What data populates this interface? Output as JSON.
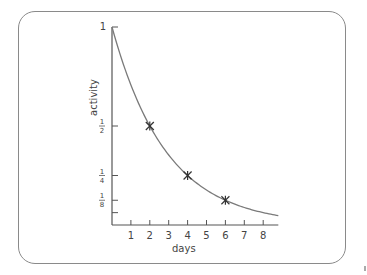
{
  "chart_data": {
    "type": "line",
    "title": "",
    "xlabel": "days",
    "ylabel": "activity",
    "xlim": [
      0,
      8.8
    ],
    "ylim": [
      0,
      1
    ],
    "x_ticks": [
      1,
      2,
      3,
      4,
      5,
      6,
      7,
      8
    ],
    "x_tick_labels": [
      "1",
      "2",
      "3",
      "4",
      "5",
      "6",
      "7",
      "8"
    ],
    "y_ticks": [
      1,
      0.5,
      0.25,
      0.125,
      0.0625
    ],
    "y_tick_labels": [
      "1",
      "1/2",
      "1/4",
      "1/8",
      ""
    ],
    "grid": false,
    "legend": null,
    "series": [
      {
        "name": "activity decay (half-life 2 days)",
        "function": "0.5^(t/2)",
        "x": [
          0,
          1,
          2,
          3,
          4,
          5,
          6,
          7,
          8,
          8.8
        ],
        "values": [
          1,
          0.707,
          0.5,
          0.354,
          0.25,
          0.177,
          0.125,
          0.088,
          0.0625,
          0.047
        ]
      }
    ],
    "markers": [
      {
        "x": 2,
        "y": 0.5,
        "symbol": "star"
      },
      {
        "x": 4,
        "y": 0.25,
        "symbol": "star"
      },
      {
        "x": 6,
        "y": 0.125,
        "symbol": "star"
      }
    ]
  },
  "labels": {
    "xlabel": "days",
    "ylabel": "activity"
  },
  "colors": {
    "curve": "#7a7a7a",
    "axis": "#555555",
    "border": "#8a8a8a"
  }
}
